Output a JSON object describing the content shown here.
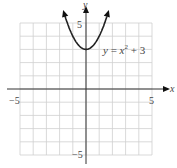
{
  "chart_data": {
    "type": "line",
    "title": "",
    "equation_label": "y = x² + 3",
    "xlabel": "x",
    "ylabel": "y",
    "xlim": [
      -5,
      5
    ],
    "ylim": [
      -5,
      5
    ],
    "grid": true,
    "x_tick_labels": [
      "−5",
      "5"
    ],
    "y_tick_labels": [
      "5",
      "−5"
    ],
    "series": [
      {
        "name": "y = x^2 + 3",
        "x": [
          -1.73,
          -1.5,
          -1,
          -0.5,
          0,
          0.5,
          1,
          1.5,
          1.73
        ],
        "y": [
          6,
          5.25,
          4,
          3.25,
          3,
          3.25,
          4,
          5.25,
          6
        ],
        "arrows_at_ends": true
      }
    ]
  },
  "labels": {
    "x_axis": "x",
    "y_axis": "y",
    "x_neg": "−5",
    "x_pos": "5",
    "y_pos": "5",
    "y_neg": "−5",
    "eq_y": "y",
    "eq_eq": " = ",
    "eq_x": "x",
    "eq_exp": "2",
    "eq_rest": " + 3"
  }
}
